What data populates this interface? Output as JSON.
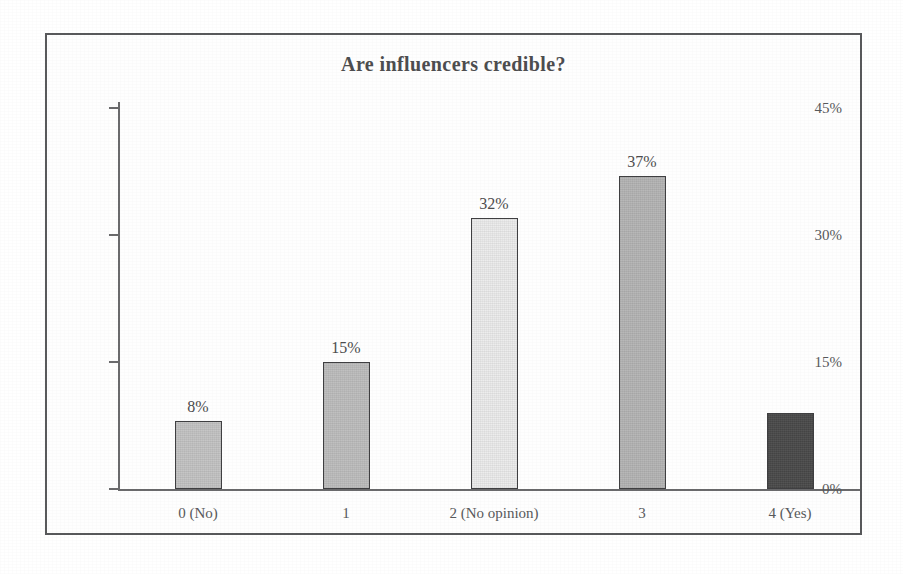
{
  "figure": {
    "frame_color": "#58595b",
    "background": "#ffffff"
  },
  "chart_data": {
    "type": "bar",
    "title": "Are influencers credible?",
    "xlabel": "",
    "ylabel": "",
    "categories": [
      "0 (No)",
      "1",
      "2 (No opinion)",
      "3",
      "4 (Yes)"
    ],
    "values": [
      8,
      15,
      32,
      37,
      9
    ],
    "value_labels": [
      "8%",
      "15%",
      "32%",
      "37%",
      ""
    ],
    "bar_colors": [
      "#c3c3c3",
      "#bdbdbd",
      "#ececec",
      "#b4b4b4",
      "#4a4a4a"
    ],
    "bar_border_color": "#3f3f41",
    "ylim": [
      0,
      45
    ],
    "yticks": [
      0,
      15,
      30,
      45
    ],
    "ytick_labels": [
      "0%",
      "15%",
      "30%",
      "45%"
    ],
    "grid": false,
    "legend": false
  }
}
